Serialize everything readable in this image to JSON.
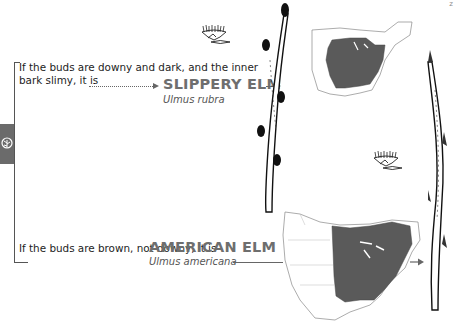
{
  "page": {
    "corner_mark": "z",
    "section_tab_icon": "tree-icon"
  },
  "clues": [
    {
      "text_line1": "If the buds are downy and dark, and the inner",
      "text_line2": "bark slimy, it is",
      "result_name": "SLIPPERY ELM",
      "result_latin": "Ulmus rubra",
      "tree_silhouette_icon": "elm-tree-silhouette",
      "range_map": "eastern-north-america-range-map",
      "twig_illustration": "slippery-elm-twig"
    },
    {
      "text_line1": "If the buds are brown, not downy, it is",
      "result_name": "AMERICAN ELM",
      "result_latin": "Ulmus americana",
      "tree_silhouette_icon": "elm-tree-silhouette",
      "range_map": "north-america-range-map",
      "twig_illustration": "american-elm-twig"
    }
  ],
  "colors": {
    "name_text": "#6e6e6e",
    "body_text": "#1d1d1d",
    "range_fill": "#5a5a5a",
    "tab_fill": "#6b6b6b"
  }
}
